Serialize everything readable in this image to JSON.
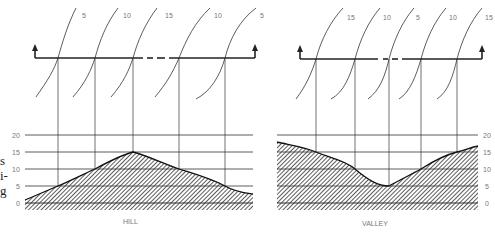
{
  "side_text": [
    "s",
    "i-",
    "g"
  ],
  "panels": [
    {
      "name": "hill",
      "caption": "HILL",
      "contour_labels": [
        "5",
        "10",
        "15",
        "10",
        "5"
      ],
      "y_ticks": [
        "20",
        "15",
        "10",
        "5",
        "0"
      ]
    },
    {
      "name": "valley",
      "caption": "VALLEY",
      "contour_labels": [
        "15",
        "10",
        "5",
        "10",
        "15"
      ],
      "y_ticks": [
        "20",
        "15",
        "10",
        "5",
        "0"
      ]
    }
  ]
}
